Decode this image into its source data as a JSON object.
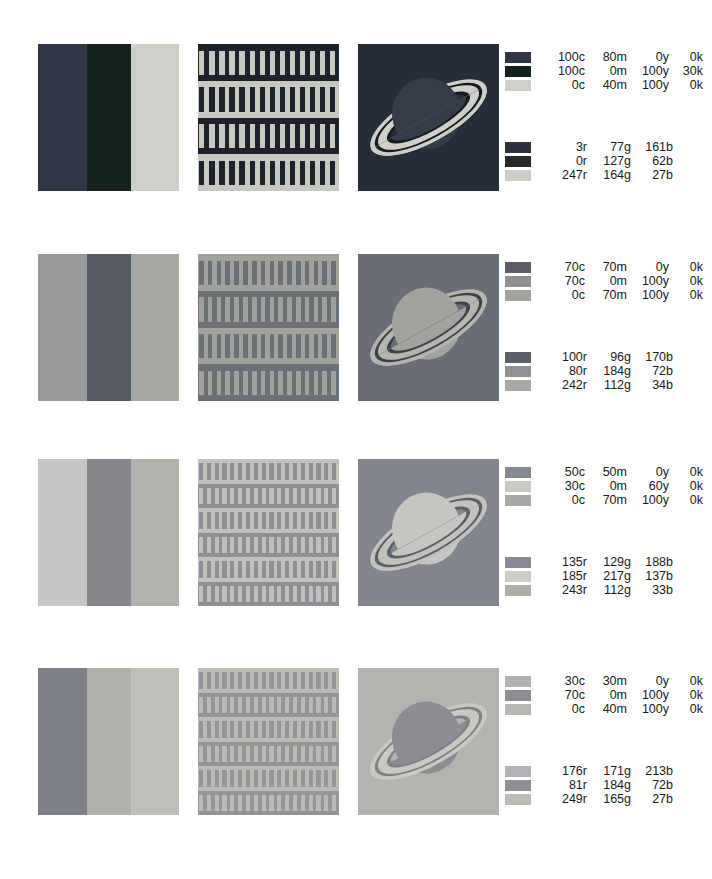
{
  "page": {
    "background": "#ffffff",
    "rows": 4,
    "panels_per_row": 3,
    "panel_kinds": [
      "vertical-bands",
      "bar-grid",
      "saturn-planet"
    ]
  },
  "rows": [
    {
      "id": "row-1",
      "bands_colors": [
        "#303643",
        "#15211b",
        "#cfcfc9"
      ],
      "grid_bg": "#1d222b",
      "grid_bar": "#c9c9c3",
      "grid_bands": 4,
      "grid_bars": 14,
      "saturn_bg": "#272d38",
      "saturn_planet": "#363c47",
      "saturn_ring": "#cfcfc9",
      "saturn_ring_dark": "#141a20",
      "cmyk": [
        {
          "swatch": "#303643",
          "c": "100c",
          "m": "80m",
          "y": "0y",
          "k": "0k"
        },
        {
          "swatch": "#15211b",
          "c": "100c",
          "m": "0m",
          "y": "100y",
          "k": "30k"
        },
        {
          "swatch": "#cfcfc9",
          "c": "0c",
          "m": "40m",
          "y": "100y",
          "k": "0k"
        }
      ],
      "rgb": [
        {
          "swatch": "#2d323d",
          "r": "3r",
          "g": "77g",
          "b": "161b"
        },
        {
          "swatch": "#232a26",
          "r": "0r",
          "g": "127g",
          "b": "62b"
        },
        {
          "swatch": "#cdcdc7",
          "r": "247r",
          "g": "164g",
          "b": "27b"
        }
      ]
    },
    {
      "id": "row-2",
      "bands_colors": [
        "#98999b",
        "#555a63",
        "#a9a9a3"
      ],
      "grid_bg": "#a2a29c",
      "grid_bar": "#6b6f76",
      "grid_bands": 4,
      "grid_bars": 16,
      "saturn_bg": "#696d75",
      "saturn_planet": "#a2a39f",
      "saturn_ring": "#b5b5b0",
      "saturn_ring_dark": "#3c4148",
      "cmyk": [
        {
          "swatch": "#595e67",
          "c": "70c",
          "m": "70m",
          "y": "0y",
          "k": "0k"
        },
        {
          "swatch": "#8e918f",
          "c": "70c",
          "m": "0m",
          "y": "100y",
          "k": "0k"
        },
        {
          "swatch": "#a3a39e",
          "c": "0c",
          "m": "70m",
          "y": "100y",
          "k": "0k"
        }
      ],
      "rgb": [
        {
          "swatch": "#5a5f68",
          "r": "100r",
          "g": "96g",
          "b": "170b"
        },
        {
          "swatch": "#8f928f",
          "r": "80r",
          "g": "184g",
          "b": "72b"
        },
        {
          "swatch": "#a8a8a3",
          "r": "242r",
          "g": "112g",
          "b": "34b"
        }
      ]
    },
    {
      "id": "row-3",
      "bands_colors": [
        "#c6c7c4",
        "#85878d",
        "#b2b2ac"
      ],
      "grid_bg": "#c2c2bd",
      "grid_bar": "#8e9096",
      "grid_bands": 6,
      "grid_bars": 18,
      "saturn_bg": "#83858c",
      "saturn_planet": "#c6c7c3",
      "saturn_ring": "#c2c3bf",
      "saturn_ring_dark": "#5a5f66",
      "cmyk": [
        {
          "swatch": "#878990",
          "c": "50c",
          "m": "50m",
          "y": "0y",
          "k": "0k"
        },
        {
          "swatch": "#c9cac4",
          "c": "30c",
          "m": "0m",
          "y": "60y",
          "k": "0k"
        },
        {
          "swatch": "#a9a9a4",
          "c": "0c",
          "m": "70m",
          "y": "100y",
          "k": "0k"
        }
      ],
      "rgb": [
        {
          "swatch": "#888a91",
          "r": "135r",
          "g": "129g",
          "b": "188b"
        },
        {
          "swatch": "#cbcdc6",
          "r": "185r",
          "g": "217g",
          "b": "137b"
        },
        {
          "swatch": "#aeaea9",
          "r": "243r",
          "g": "112g",
          "b": "33b"
        }
      ]
    },
    {
      "id": "row-4",
      "bands_colors": [
        "#7f8188",
        "#b0b0ab",
        "#c0c0ba"
      ],
      "grid_bg": "#bcbcb7",
      "grid_bar": "#949699",
      "grid_bands": 6,
      "grid_bars": 18,
      "saturn_bg": "#b3b4b0",
      "saturn_planet": "#8b8d92",
      "saturn_ring": "#c9c9c4",
      "saturn_ring_dark": "#7e8085",
      "cmyk": [
        {
          "swatch": "#b0b1b4",
          "c": "30c",
          "m": "30m",
          "y": "0y",
          "k": "0k"
        },
        {
          "swatch": "#8b8d91",
          "c": "70c",
          "m": "0m",
          "y": "100y",
          "k": "0k"
        },
        {
          "swatch": "#b8b8b3",
          "c": "0c",
          "m": "40m",
          "y": "100y",
          "k": "0k"
        }
      ],
      "rgb": [
        {
          "swatch": "#b2b3b6",
          "r": "176r",
          "g": "171g",
          "b": "213b"
        },
        {
          "swatch": "#8d8f93",
          "r": "81r",
          "g": "184g",
          "b": "72b"
        },
        {
          "swatch": "#bcbcb7",
          "r": "249r",
          "g": "165g",
          "b": "27b"
        }
      ]
    }
  ],
  "layout": {
    "row_tops": [
      44,
      254,
      459,
      668
    ],
    "panel_lefts": [
      38,
      198,
      358
    ],
    "panel_size": [
      141,
      147
    ],
    "legend_left": 505
  }
}
